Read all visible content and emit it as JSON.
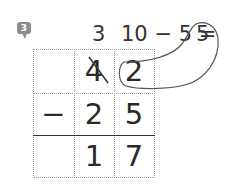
{
  "problem": {
    "number": "3",
    "badge_color": "#8c8c8c"
  },
  "borrow_note": {
    "tens_after_borrow": "3",
    "ones_calc": "10 − 5 =",
    "ones_result": "5"
  },
  "grid": {
    "rows": [
      {
        "c0": "",
        "c1": "4",
        "c2": "2"
      },
      {
        "c0": "−",
        "c1": "2",
        "c2": "5"
      },
      {
        "c0": "",
        "c1": "1",
        "c2": "7"
      }
    ],
    "crossed_digit": "4",
    "circled_digit": "2"
  }
}
